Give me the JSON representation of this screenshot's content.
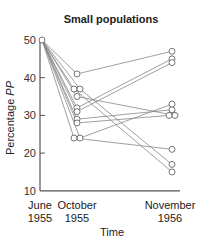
{
  "chart_data": {
    "type": "line",
    "title": "Small populations",
    "xlabel": "Time",
    "ylabel": "Percentage PP",
    "ylabel_parts": {
      "prefix": "Percentage ",
      "italic": "PP"
    },
    "ylim": [
      10,
      50
    ],
    "yticks": [
      10,
      20,
      30,
      40,
      50
    ],
    "grid": false,
    "legend": null,
    "categories": [
      {
        "line1": "June",
        "line2": "1955"
      },
      {
        "line1": "October",
        "line2": "1955"
      },
      {
        "line1": "November",
        "line2": "1956"
      }
    ],
    "series": [
      {
        "name": "population-1",
        "values": [
          50,
          41,
          47
        ]
      },
      {
        "name": "population-2",
        "values": [
          50,
          37,
          15
        ]
      },
      {
        "name": "population-3",
        "values": [
          50,
          37,
          17
        ]
      },
      {
        "name": "population-4",
        "values": [
          50,
          35,
          30
        ]
      },
      {
        "name": "population-5",
        "values": [
          50,
          32,
          45
        ]
      },
      {
        "name": "population-6",
        "values": [
          50,
          31,
          44
        ]
      },
      {
        "name": "population-7",
        "values": [
          50,
          29,
          31.5
        ]
      },
      {
        "name": "population-8",
        "values": [
          50,
          28,
          30
        ]
      },
      {
        "name": "population-9",
        "values": [
          50,
          24,
          21
        ]
      },
      {
        "name": "population-10",
        "values": [
          50,
          24,
          33
        ]
      }
    ],
    "marker_offsets": {
      "october": [
        0,
        -3,
        3,
        0,
        0,
        0,
        0,
        0,
        -3,
        3
      ],
      "november": [
        0,
        0,
        0,
        3,
        0,
        0,
        0,
        -3,
        0,
        0
      ]
    }
  },
  "colors": {
    "line": "#888888",
    "marker": "#666666",
    "axis": "#555555",
    "text": "#222222"
  }
}
